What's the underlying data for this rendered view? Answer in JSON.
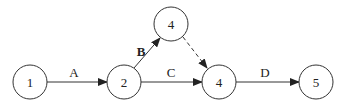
{
  "diagram": {
    "type": "activity-on-arrow network",
    "nodes": [
      {
        "id": "n1",
        "label": "1",
        "x": 30,
        "y": 82
      },
      {
        "id": "n2",
        "label": "2",
        "x": 124,
        "y": 82
      },
      {
        "id": "n3",
        "label": "4",
        "x": 171,
        "y": 24
      },
      {
        "id": "n4",
        "label": "4",
        "x": 219,
        "y": 82
      },
      {
        "id": "n5",
        "label": "5",
        "x": 316,
        "y": 82
      }
    ],
    "edges": [
      {
        "from": "n1",
        "to": "n2",
        "label": "A",
        "style": "solid"
      },
      {
        "from": "n2",
        "to": "n3",
        "label": "B",
        "style": "solid",
        "bold_label": true
      },
      {
        "from": "n2",
        "to": "n4",
        "label": "C",
        "style": "solid"
      },
      {
        "from": "n3",
        "to": "n4",
        "label": "",
        "style": "dashed"
      },
      {
        "from": "n4",
        "to": "n5",
        "label": "D",
        "style": "solid"
      }
    ]
  }
}
